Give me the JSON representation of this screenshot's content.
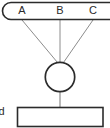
{
  "diagram": {
    "type": "node-link-diagram",
    "background_color": "#ffffff",
    "stroke_color": "#2b2b2b",
    "edge_color": "#8c8c8c",
    "text_color": "#2b2b2b",
    "top_group": {
      "shape": "rounded-rectangle-capsule",
      "clipped_left": true,
      "clipped_right": true,
      "labels": [
        {
          "text": "A",
          "x": 22,
          "y": 11
        },
        {
          "text": "B",
          "x": 60,
          "y": 11
        },
        {
          "text": "C",
          "x": 93,
          "y": 11
        }
      ]
    },
    "center_node": {
      "shape": "circle",
      "cx": 60,
      "cy": 77,
      "r": 15,
      "label": ""
    },
    "bottom_node": {
      "shape": "rectangle",
      "x": 17,
      "y": 107,
      "width": 86,
      "height": 20,
      "label": ""
    },
    "side_label": {
      "text": "d",
      "clipped_left": true,
      "x": 2,
      "y": 112
    },
    "edges": [
      {
        "from": "A",
        "to": "center",
        "x1": 22,
        "y1": 20,
        "x2": 57,
        "y2": 62
      },
      {
        "from": "B",
        "to": "center",
        "x1": 60,
        "y1": 20,
        "x2": 60,
        "y2": 62
      },
      {
        "from": "C",
        "to": "center",
        "x1": 93,
        "y1": 20,
        "x2": 64,
        "y2": 62
      },
      {
        "from": "center",
        "to": "bottom",
        "x1": 60,
        "y1": 92,
        "x2": 60,
        "y2": 107
      }
    ]
  }
}
